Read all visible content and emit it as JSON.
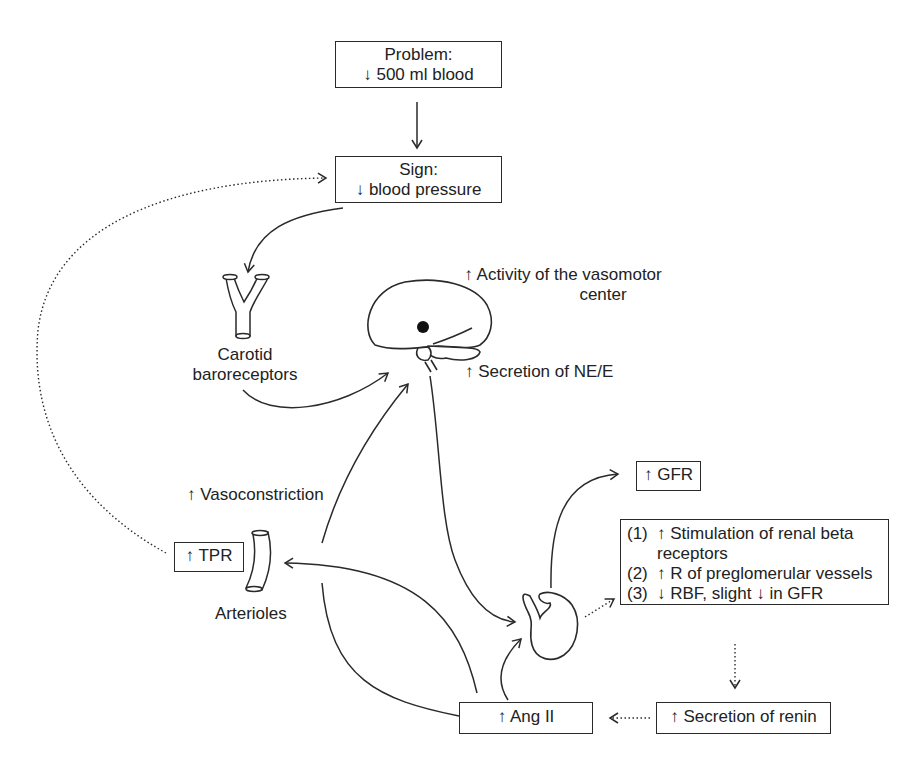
{
  "diagram": {
    "problem": {
      "title": "Problem:",
      "detail": "↓ 500 ml blood"
    },
    "sign": {
      "title": "Sign:",
      "detail": "↓ blood pressure"
    },
    "carotid": {
      "line1": "Carotid",
      "line2": "baroreceptors"
    },
    "vasomotor": {
      "line1": "↑ Activity of the vasomotor",
      "line2": "center"
    },
    "ne_e": "↑ Secretion of NE/E",
    "vasoconstriction": "↑ Vasoconstriction",
    "tpr": "↑ TPR",
    "arterioles": "Arterioles",
    "gfr": "↑ GFR",
    "renal_effects": [
      {
        "num": "(1)",
        "text": "↑ Stimulation of renal beta",
        "cont": "receptors"
      },
      {
        "num": "(2)",
        "text": "↑ R of preglomerular vessels"
      },
      {
        "num": "(3)",
        "text": "↓ RBF, slight ↓ in GFR"
      }
    ],
    "renin": "↑ Secretion of renin",
    "ang2": "↑ Ang II"
  },
  "icons": {
    "carotid": "carotid-bifurcation-icon",
    "brain": "brain-icon",
    "arteriole": "arteriole-vessel-icon",
    "kidney": "kidney-icon"
  },
  "colors": {
    "stroke": "#2a2a2a",
    "text": "#222222",
    "background": "#ffffff"
  }
}
